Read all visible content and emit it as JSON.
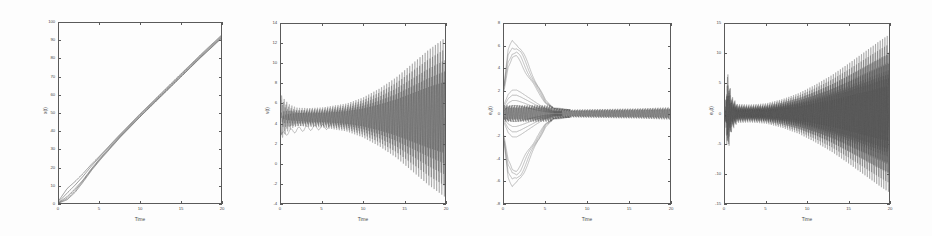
{
  "figure": {
    "title": "",
    "background": "#ffffff",
    "line_color": "#4d4d4d",
    "axis_color": "#5a5a5a",
    "panel_count": 4
  },
  "chart_data": [
    {
      "type": "line",
      "title": "",
      "xlabel": "Time",
      "ylabel": "x(t)",
      "xlim": [
        0,
        20
      ],
      "ylim": [
        0,
        100
      ],
      "xticks": [
        0,
        5,
        10,
        15,
        20
      ],
      "yticks": [
        0,
        10,
        20,
        30,
        40,
        50,
        60,
        70,
        80,
        90,
        100
      ],
      "grid": false,
      "legend": "none",
      "description": "Positions of all agents grow nearly linearly from near zero to about 93 at t=20; several trajectories fan out near the origin then merge into one thick line.",
      "series": [
        {
          "name": "x1",
          "x": [
            0,
            1,
            2,
            3,
            4,
            5,
            7.5,
            10,
            12.5,
            15,
            17.5,
            20
          ],
          "values": [
            1.5,
            8.0,
            12.0,
            16.5,
            21.5,
            26.0,
            38.0,
            49.5,
            60.5,
            71.5,
            82.5,
            93.0
          ]
        },
        {
          "name": "x2",
          "x": [
            0,
            1,
            2,
            3,
            4,
            5,
            7.5,
            10,
            12.5,
            15,
            17.5,
            20
          ],
          "values": [
            0.8,
            5.5,
            10.0,
            15.0,
            20.5,
            25.5,
            37.5,
            49.0,
            60.0,
            71.0,
            82.0,
            92.5
          ]
        },
        {
          "name": "x3",
          "x": [
            0,
            1,
            2,
            3,
            4,
            5,
            7.5,
            10,
            12.5,
            15,
            17.5,
            20
          ],
          "values": [
            0.4,
            3.5,
            8.0,
            13.0,
            19.0,
            24.5,
            37.0,
            48.5,
            59.5,
            70.5,
            81.5,
            92.0
          ]
        },
        {
          "name": "x4",
          "x": [
            0,
            1,
            2,
            3,
            4,
            5,
            7.5,
            10,
            12.5,
            15,
            17.5,
            20
          ],
          "values": [
            0.2,
            2.5,
            7.0,
            12.5,
            18.5,
            24.0,
            36.5,
            48.0,
            59.0,
            70.0,
            81.0,
            91.5
          ]
        },
        {
          "name": "x5",
          "x": [
            0,
            1,
            2,
            3,
            4,
            5,
            7.5,
            10,
            12.5,
            15,
            17.5,
            20
          ],
          "values": [
            0.0,
            1.8,
            6.0,
            11.8,
            18.0,
            23.5,
            36.2,
            47.8,
            58.8,
            69.8,
            80.8,
            91.2
          ]
        }
      ]
    },
    {
      "type": "line",
      "title": "",
      "xlabel": "Time",
      "ylabel": "v(t)",
      "xlim": [
        0,
        20
      ],
      "ylim": [
        -4,
        14
      ],
      "xticks": [
        0,
        5,
        10,
        15,
        20
      ],
      "yticks": [
        -4,
        -2,
        0,
        2,
        4,
        6,
        8,
        10,
        12,
        14
      ],
      "grid": false,
      "legend": "none",
      "description": "Velocities oscillate about a mean near 4.6 with an amplitude that is small for t<5 and grows steadily, reaching roughly +12.5 / -3.5 at t=20.",
      "envelope": {
        "mean": 4.6,
        "amplitude_x": [
          0,
          1,
          2,
          5,
          8,
          10,
          12,
          14,
          16,
          18,
          20
        ],
        "amplitude": [
          1.6,
          1.1,
          0.9,
          1.0,
          1.4,
          2.0,
          2.9,
          4.0,
          5.4,
          6.8,
          8.0
        ],
        "oscillation_cycles": 64
      }
    },
    {
      "type": "line",
      "title": "",
      "xlabel": "Time",
      "ylabel": "e_x(t)",
      "xlim": [
        0,
        20
      ],
      "ylim": [
        -8,
        8
      ],
      "xticks": [
        0,
        5,
        10,
        15,
        20
      ],
      "yticks": [
        -8,
        -6,
        -4,
        -2,
        0,
        2,
        4,
        6,
        8
      ],
      "grid": false,
      "legend": "none",
      "description": "Position errors start spread between about -6.5 and +6.5, converge toward zero by t≈6, then persist as a thin band of small fast oscillations of about +/-0.5 for the remainder.",
      "envelope": {
        "mean": 0,
        "amplitude_x": [
          0,
          0.5,
          1,
          1.5,
          2,
          3,
          4,
          5,
          6,
          8,
          12,
          16,
          20
        ],
        "amplitude": [
          2.5,
          5.5,
          6.5,
          6.4,
          5.8,
          4.2,
          2.6,
          1.2,
          0.5,
          0.35,
          0.4,
          0.45,
          0.55
        ],
        "oscillation_cycles": 66
      },
      "inner_envelope": {
        "amplitude_x": [
          0,
          0.5,
          1,
          1.5,
          2,
          3,
          4,
          5,
          6
        ],
        "amplitude": [
          0.8,
          1.7,
          2.1,
          2.1,
          1.9,
          1.4,
          0.9,
          0.45,
          0.2
        ]
      }
    },
    {
      "type": "line",
      "title": "",
      "xlabel": "Time",
      "ylabel": "e_v(t)",
      "xlim": [
        0,
        20
      ],
      "ylim": [
        -15,
        15
      ],
      "xticks": [
        0,
        5,
        10,
        15,
        20
      ],
      "yticks": [
        -15,
        -10,
        -5,
        0,
        5,
        10,
        15
      ],
      "grid": false,
      "legend": "none",
      "description": "Velocity errors show an initial transient spike to about +/-7 near t=0, settle to a narrow band of about +/-1.5 until t≈5, then the oscillation amplitude grows monotonically to roughly +/-13 at t=20.",
      "envelope": {
        "mean": 0,
        "amplitude_x": [
          0,
          0.3,
          0.8,
          1.5,
          3,
          5,
          7,
          9,
          11,
          13,
          15,
          17,
          19,
          20
        ],
        "amplitude": [
          0.5,
          7.0,
          3.0,
          1.6,
          1.5,
          1.7,
          2.4,
          3.4,
          4.8,
          6.4,
          8.3,
          10.3,
          12.3,
          13.2
        ],
        "oscillation_cycles": 70
      }
    }
  ]
}
